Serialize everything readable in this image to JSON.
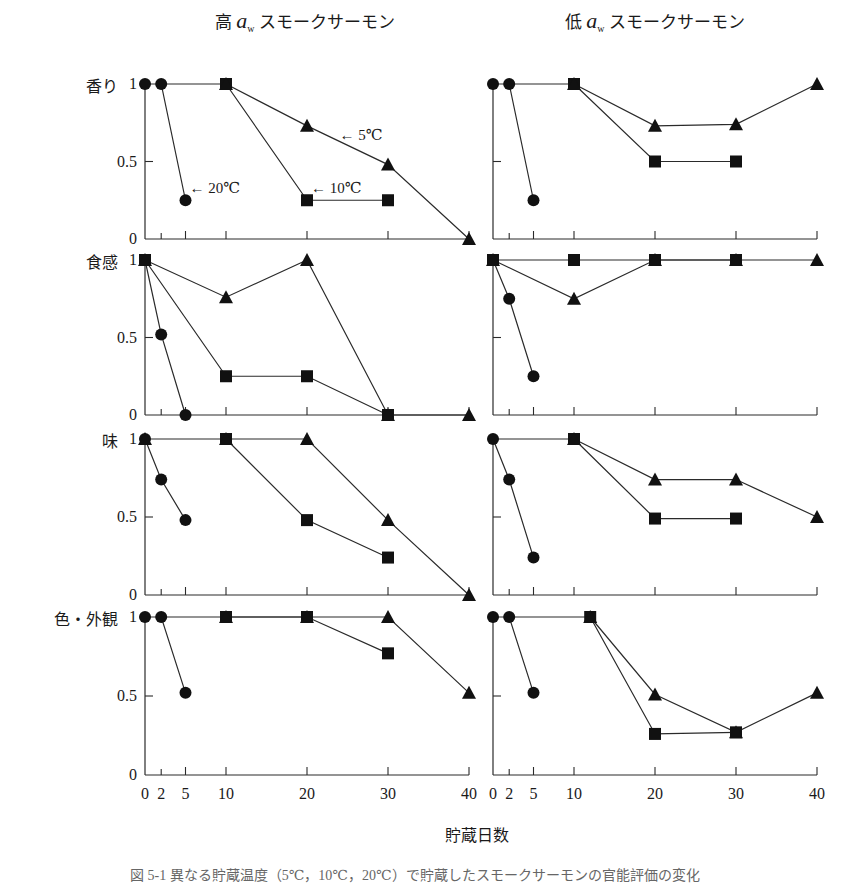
{
  "figure": {
    "column_titles": [
      "高 aw スモークサーモン",
      "低 aw スモークサーモン"
    ],
    "column_title_parts": [
      {
        "prefix": "高",
        "symbol": "a",
        "subscript": "w",
        "suffix": "スモークサーモン"
      },
      {
        "prefix": "低",
        "symbol": "a",
        "subscript": "w",
        "suffix": "スモークサーモン"
      }
    ],
    "row_labels": [
      "香り",
      "食感",
      "味",
      "色・外観"
    ],
    "xlabel": "貯蔵日数",
    "caption": "図 5-1  異なる貯蔵温度（5℃，10℃，20℃）で貯蔵したスモークサーモンの官能評価の変化",
    "annotations": [
      {
        "panel": "0-0",
        "text": "← 20℃",
        "day": 5.5,
        "value": 0.33
      },
      {
        "panel": "0-0",
        "text": "← 10℃",
        "day": 20.5,
        "value": 0.33
      },
      {
        "panel": "0-0",
        "text": "← 5℃",
        "day": 24,
        "value": 0.67
      }
    ]
  },
  "chart_data": {
    "type": "line",
    "title": "",
    "xlabel": "貯蔵日数",
    "ylabel": "",
    "x_ticks": [
      0,
      2,
      5,
      10,
      20,
      30,
      40
    ],
    "y_ticks": [
      0,
      0.5,
      1
    ],
    "xlim": [
      0,
      40
    ],
    "ylim": [
      0,
      1
    ],
    "grid": false,
    "legend": {
      "position": "inline annotations (top-left panel)",
      "entries": [
        {
          "name": "20℃",
          "marker": "circle"
        },
        {
          "name": "10℃",
          "marker": "square"
        },
        {
          "name": "5℃",
          "marker": "triangle"
        }
      ]
    },
    "panels": [
      {
        "row": "香り",
        "column": "高 aw スモークサーモン",
        "series": [
          {
            "name": "20℃",
            "marker": "circle",
            "x": [
              0,
              2,
              5
            ],
            "y": [
              1,
              1,
              0.25
            ]
          },
          {
            "name": "20℃→10℃ link",
            "marker": "none",
            "x": [
              2,
              10
            ],
            "y": [
              1,
              1
            ]
          },
          {
            "name": "10℃",
            "marker": "square",
            "x": [
              10,
              20,
              30
            ],
            "y": [
              1,
              0.25,
              0.25
            ]
          },
          {
            "name": "5℃",
            "marker": "triangle",
            "x": [
              10,
              20,
              30,
              40
            ],
            "y": [
              1,
              0.73,
              0.48,
              0
            ]
          }
        ]
      },
      {
        "row": "香り",
        "column": "低 aw スモークサーモン",
        "series": [
          {
            "name": "20℃",
            "marker": "circle",
            "x": [
              0,
              2,
              5
            ],
            "y": [
              1,
              1,
              0.25
            ]
          },
          {
            "name": "20℃→10℃ link",
            "marker": "none",
            "x": [
              2,
              10
            ],
            "y": [
              1,
              1
            ]
          },
          {
            "name": "10℃",
            "marker": "square",
            "x": [
              10,
              20,
              30
            ],
            "y": [
              1,
              0.5,
              0.5
            ]
          },
          {
            "name": "5℃",
            "marker": "triangle",
            "x": [
              10,
              20,
              30,
              40
            ],
            "y": [
              1,
              0.73,
              0.74,
              1
            ]
          }
        ]
      },
      {
        "row": "食感",
        "column": "高 aw スモークサーモン",
        "series": [
          {
            "name": "20℃",
            "marker": "circle",
            "x": [
              0,
              2,
              5
            ],
            "y": [
              1,
              0.52,
              0
            ]
          },
          {
            "name": "10℃",
            "marker": "square",
            "x": [
              0,
              10,
              20,
              30
            ],
            "y": [
              1,
              0.25,
              0.25,
              0
            ]
          },
          {
            "name": "5℃",
            "marker": "triangle",
            "x": [
              0,
              10,
              20,
              30,
              40
            ],
            "y": [
              1,
              0.76,
              1,
              0,
              0
            ]
          }
        ]
      },
      {
        "row": "食感",
        "column": "低 aw スモークサーモン",
        "series": [
          {
            "name": "20℃",
            "marker": "circle",
            "x": [
              0,
              2,
              5
            ],
            "y": [
              1,
              0.75,
              0.25
            ]
          },
          {
            "name": "10℃",
            "marker": "square",
            "x": [
              0,
              10,
              20,
              30
            ],
            "y": [
              1,
              1,
              1,
              1
            ]
          },
          {
            "name": "5℃",
            "marker": "triangle",
            "x": [
              0,
              10,
              20,
              30,
              40
            ],
            "y": [
              1,
              0.75,
              1,
              1,
              1
            ]
          }
        ]
      },
      {
        "row": "味",
        "column": "高 aw スモークサーモン",
        "series": [
          {
            "name": "20℃",
            "marker": "circle",
            "x": [
              0,
              2,
              5
            ],
            "y": [
              1,
              0.74,
              0.48
            ]
          },
          {
            "name": "10℃",
            "marker": "square",
            "x": [
              10,
              20,
              30
            ],
            "y": [
              1,
              0.48,
              0.24
            ]
          },
          {
            "name": "5℃",
            "marker": "triangle",
            "x": [
              0,
              10,
              20,
              30,
              40
            ],
            "y": [
              1,
              1,
              1,
              0.48,
              0
            ]
          }
        ]
      },
      {
        "row": "味",
        "column": "低 aw スモークサーモン",
        "series": [
          {
            "name": "20℃",
            "marker": "circle",
            "x": [
              0,
              2,
              5
            ],
            "y": [
              1,
              0.74,
              0.24
            ]
          },
          {
            "name": "20℃→10℃ link",
            "marker": "none",
            "x": [
              0,
              10
            ],
            "y": [
              1,
              1
            ]
          },
          {
            "name": "10℃",
            "marker": "square",
            "x": [
              10,
              20,
              30
            ],
            "y": [
              1,
              0.49,
              0.49
            ]
          },
          {
            "name": "5℃",
            "marker": "triangle",
            "x": [
              10,
              20,
              30,
              40
            ],
            "y": [
              1,
              0.74,
              0.74,
              0.5
            ]
          }
        ]
      },
      {
        "row": "色・外観",
        "column": "高 aw スモークサーモン",
        "series": [
          {
            "name": "20℃",
            "marker": "circle",
            "x": [
              0,
              2,
              5
            ],
            "y": [
              1,
              1,
              0.52
            ]
          },
          {
            "name": "20℃→10℃ link",
            "marker": "none",
            "x": [
              2,
              10
            ],
            "y": [
              1,
              1
            ]
          },
          {
            "name": "10℃",
            "marker": "square",
            "x": [
              10,
              20,
              30
            ],
            "y": [
              1,
              1,
              0.77
            ]
          },
          {
            "name": "5℃",
            "marker": "triangle",
            "x": [
              10,
              20,
              30,
              40
            ],
            "y": [
              1,
              1,
              1,
              0.52
            ]
          }
        ]
      },
      {
        "row": "色・外観",
        "column": "低 aw スモークサーモン",
        "series": [
          {
            "name": "20℃",
            "marker": "circle",
            "x": [
              0,
              2,
              5
            ],
            "y": [
              1,
              1,
              0.52
            ]
          },
          {
            "name": "20℃→10℃ link",
            "marker": "none",
            "x": [
              2,
              12
            ],
            "y": [
              1,
              1
            ]
          },
          {
            "name": "10℃",
            "marker": "square",
            "x": [
              12,
              20,
              30
            ],
            "y": [
              1,
              0.26,
              0.27
            ]
          },
          {
            "name": "5℃",
            "marker": "triangle",
            "x": [
              12,
              20,
              30,
              40
            ],
            "y": [
              1,
              0.51,
              0.27,
              0.52
            ]
          }
        ]
      }
    ]
  },
  "layout": {
    "columns_x0": [
      145,
      493
    ],
    "px_per_day": 8.1,
    "rows_y": [
      [
        84,
        239
      ],
      [
        260,
        415
      ],
      [
        439,
        595
      ],
      [
        617,
        775
      ]
    ],
    "colors": {
      "line": "#2a2a2a",
      "marker": "#111111",
      "text": "#1a1a1a",
      "caption": "#777777"
    }
  }
}
